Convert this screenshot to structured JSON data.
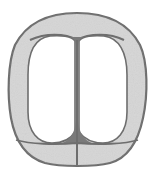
{
  "diagram": {
    "type": "cell-cleavage-drawing",
    "colors": {
      "background": "#ffffff",
      "outline": "#6e6e6e",
      "stipple": "#c8c8c8",
      "cell_fill": "#ffffff",
      "junction_fill": "#7a7a7a"
    },
    "regions": [
      {
        "id": "outer-envelope",
        "label": ""
      },
      {
        "id": "left-cell",
        "label": ""
      },
      {
        "id": "right-cell",
        "label": ""
      },
      {
        "id": "top-cap",
        "label": ""
      },
      {
        "id": "bottom-left-cell",
        "label": ""
      },
      {
        "id": "bottom-right-cell",
        "label": ""
      }
    ]
  }
}
